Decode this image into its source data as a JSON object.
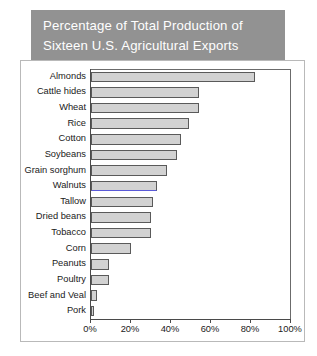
{
  "header": {
    "title_line_1": "Percentage of Total Production of",
    "title_line_2": "Sixteen U.S. Agricultural Exports",
    "background_color": "#929292",
    "text_color": "#ffffff"
  },
  "colors": {
    "bar_fill": "#d2d2d2",
    "bar_outline": "#5a5a5a",
    "selected_highlight": "#5a5ad8",
    "axis": "#4a4a4a",
    "panel_border": "#b9b9b9",
    "panel_background": "#ffffff"
  },
  "chart_data": {
    "type": "bar",
    "orientation": "horizontal",
    "title": "Percentage of Total Production of Sixteen U.S. Agricultural Exports",
    "xlabel": "",
    "ylabel": "",
    "xlim": [
      0,
      100
    ],
    "x_unit": "%",
    "grid": false,
    "legend": null,
    "tick_labels": [
      "0%",
      "20%",
      "40%",
      "60%",
      "80%",
      "100%"
    ],
    "tick_values": [
      0,
      20,
      40,
      60,
      80,
      100
    ],
    "categories": [
      "Almonds",
      "Cattle hides",
      "Wheat",
      "Rice",
      "Cotton",
      "Soybeans",
      "Grain sorghum",
      "Walnuts",
      "Tallow",
      "Dried beans",
      "Tobacco",
      "Corn",
      "Peanuts",
      "Poultry",
      "Beef and Veal",
      "Pork"
    ],
    "values": [
      82,
      54,
      54,
      49,
      45,
      43,
      38,
      33,
      31,
      30,
      30,
      20,
      9,
      9,
      3,
      1.5
    ],
    "selected_category": "Walnuts"
  }
}
